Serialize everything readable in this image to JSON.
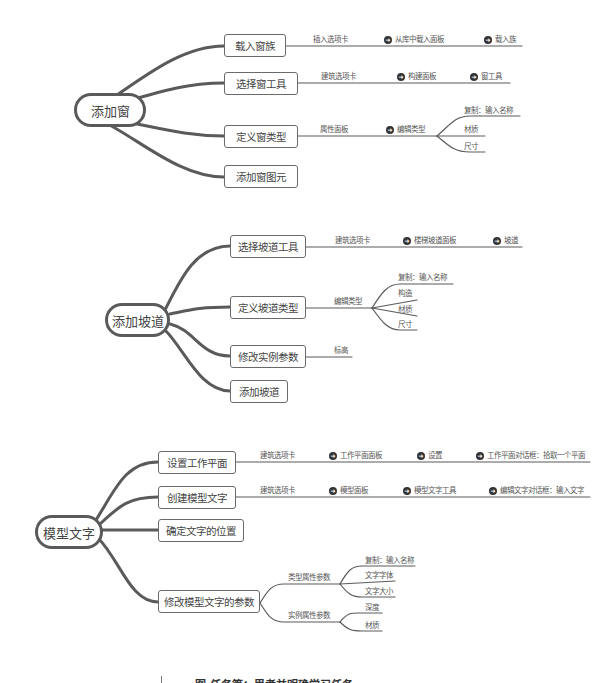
{
  "maps": [
    {
      "root": "添加窗",
      "branches": [
        {
          "label": "载入窗族",
          "steps": [
            "插入选项卡",
            "从库中载入面板",
            "载入族"
          ]
        },
        {
          "label": "选择窗工具",
          "steps": [
            "建筑选项卡",
            "构建面板",
            "窗工具"
          ]
        },
        {
          "label": "定义窗类型",
          "steps": [
            "属性面板",
            "编辑类型"
          ],
          "children": [
            "复制：输入名称",
            "材质",
            "尺寸"
          ]
        },
        {
          "label": "添加窗图元"
        }
      ]
    },
    {
      "root": "添加坡道",
      "branches": [
        {
          "label": "选择坡道工具",
          "steps": [
            "建筑选项卡",
            "楼梯坡道面板",
            "坡道"
          ]
        },
        {
          "label": "定义坡道类型",
          "steps": [
            "编辑类型"
          ],
          "children": [
            "复制：输入名称",
            "构造",
            "材质",
            "尺寸"
          ]
        },
        {
          "label": "修改实例参数",
          "steps": [
            "标高"
          ]
        },
        {
          "label": "添加坡道"
        }
      ]
    },
    {
      "root": "模型文字",
      "branches": [
        {
          "label": "设置工作平面",
          "steps": [
            "建筑选项卡",
            "工作平面面板",
            "设置",
            "工作平面对话框：拾取一个平面"
          ]
        },
        {
          "label": "创建模型文字",
          "steps": [
            "建筑选项卡",
            "模型面板",
            "模型文字工具",
            "编辑文字对话框：输入文字"
          ]
        },
        {
          "label": "确定文字的位置"
        },
        {
          "label": "修改模型文字的参数",
          "groups": [
            {
              "label": "类型属性参数",
              "children": [
                "复制：输入名称",
                "文字字体",
                "文字大小"
              ]
            },
            {
              "label": "实例属性参数",
              "children": [
                "深度",
                "材质"
              ]
            }
          ]
        }
      ]
    }
  ],
  "caption": "图   任务篇：思考并明确学习任务",
  "icons": {
    "step_arrow": "arrow-right-circle-icon"
  },
  "colors": {
    "line": "#5a5a5a",
    "text": "#444444",
    "background": "#ffffff"
  }
}
